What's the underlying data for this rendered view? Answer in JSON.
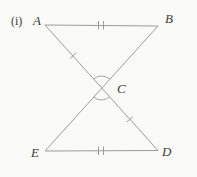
{
  "figure": {
    "index_label": "(i)",
    "type": "geometry-diagram",
    "points": {
      "a": "A",
      "b": "B",
      "c": "C",
      "d": "D",
      "e": "E"
    },
    "segments": [
      "AB",
      "ED",
      "AD",
      "BE"
    ],
    "marks": {
      "ab_tick_count": 2,
      "ed_tick_count": 2,
      "ac_tick_count": 1,
      "cd_tick_count": 1,
      "angle_arcs_at_c": 2
    },
    "colors": {
      "line": "#9b9b9b",
      "label": "#3b3b3b",
      "background": "#fafaf8"
    }
  }
}
